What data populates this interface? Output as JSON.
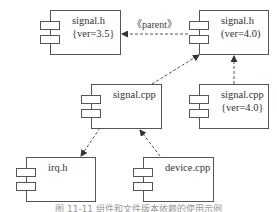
{
  "diagram": {
    "type": "uml-component-diagram",
    "components": [
      {
        "id": "signal_h_35",
        "name": "signal.h",
        "tag": "{ver=3.5}"
      },
      {
        "id": "signal_h_40",
        "name": "signal.h",
        "tag": "(ver=4.0)"
      },
      {
        "id": "signal_cpp",
        "name": "signal.cpp",
        "tag": ""
      },
      {
        "id": "signal_cpp_40",
        "name": "signal.cpp",
        "tag": "{ver=4.0}"
      },
      {
        "id": "irq_h",
        "name": "irq.h",
        "tag": ""
      },
      {
        "id": "device_cpp",
        "name": "device.cpp",
        "tag": ""
      }
    ],
    "dependencies": [
      {
        "from": "signal_h_40",
        "to": "signal_h_35",
        "label": "《parent》"
      },
      {
        "from": "signal_cpp",
        "to": "signal_h_40",
        "label": ""
      },
      {
        "from": "signal_cpp_40",
        "to": "signal_h_40",
        "label": ""
      },
      {
        "from": "signal_cpp",
        "to": "irq_h",
        "label": ""
      },
      {
        "from": "device_cpp",
        "to": "signal_cpp",
        "label": ""
      }
    ],
    "caption": "图 11-11  组件和文件版本依赖的使用示例"
  }
}
